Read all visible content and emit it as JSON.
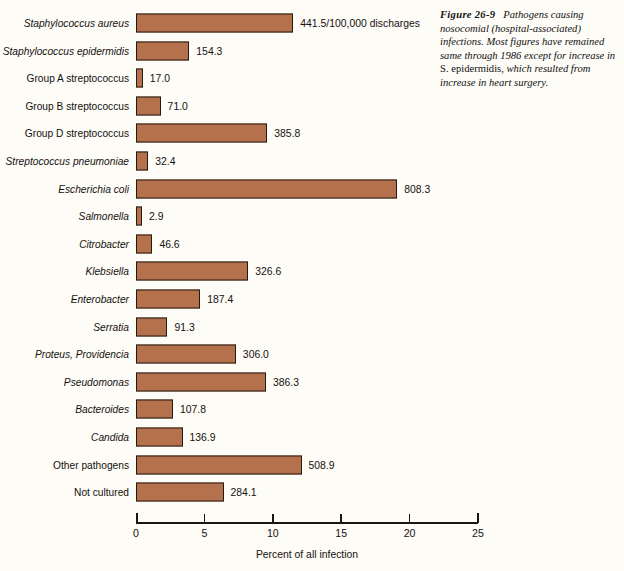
{
  "figure": {
    "label": "Figure  26-9",
    "caption_part1": "Pathogens causing nosocomial (hospital-associated) infections. Most figures have remained same through 1986 except for increase in ",
    "caption_species": "S. epidermidis,",
    "caption_part2": " which resulted from increase in heart surgery."
  },
  "chart_data": {
    "type": "bar",
    "orientation": "horizontal",
    "title": "",
    "xlabel": "Percent of all infection",
    "ylabel": "",
    "xlim": [
      0,
      25
    ],
    "xticks": [
      0,
      5,
      10,
      15,
      20,
      25
    ],
    "xtick_labels": [
      "0",
      "5",
      "10",
      "15",
      "20",
      "25"
    ],
    "grid": false,
    "legend": null,
    "value_unit": "rate per 100,000 discharges",
    "first_value_annotation": "441.5/100,000 discharges",
    "categories": [
      "Staphylococcus aureus",
      "Staphylococcus epidermidis",
      "Group A streptococcus",
      "Group B streptococcus",
      "Group D streptococcus",
      "Streptococcus pneumoniae",
      "Escherichia coli",
      "Salmonella",
      "Citrobacter",
      "Klebsiella",
      "Enterobacter",
      "Serratia",
      "Proteus, Providencia",
      "Pseudomonas",
      "Bacteroides",
      "Candida",
      "Other pathogens",
      "Not cultured"
    ],
    "category_styles": [
      "italic",
      "italic",
      "roman",
      "roman",
      "roman",
      "italic",
      "italic",
      "italic",
      "italic",
      "italic",
      "italic",
      "italic",
      "italic",
      "italic",
      "italic",
      "italic",
      "roman",
      "roman"
    ],
    "values": [
      441.5,
      154.3,
      17.0,
      71.0,
      385.8,
      32.4,
      808.3,
      2.9,
      46.6,
      326.6,
      187.4,
      91.3,
      306.0,
      386.3,
      107.8,
      136.9,
      508.9,
      284.1
    ],
    "value_labels": [
      "441.5/100,000 discharges",
      "154.3",
      "17.0",
      "71.0",
      "385.8",
      "32.4",
      "808.3",
      "2.9",
      "46.6",
      "326.6",
      "187.4",
      "91.3",
      "306.0",
      "386.3",
      "107.8",
      "136.9",
      "508.9",
      "284.1"
    ],
    "percent_of_all_infection": [
      11.5,
      3.9,
      0.5,
      1.8,
      9.6,
      0.9,
      19.1,
      0.2,
      1.2,
      8.2,
      4.7,
      2.3,
      7.3,
      9.5,
      2.7,
      3.4,
      12.1,
      6.4
    ]
  },
  "colors": {
    "bar_fill": "#b5714c",
    "bar_stroke": "#231a14",
    "text": "#15110e",
    "background": "#fdfcf7"
  }
}
